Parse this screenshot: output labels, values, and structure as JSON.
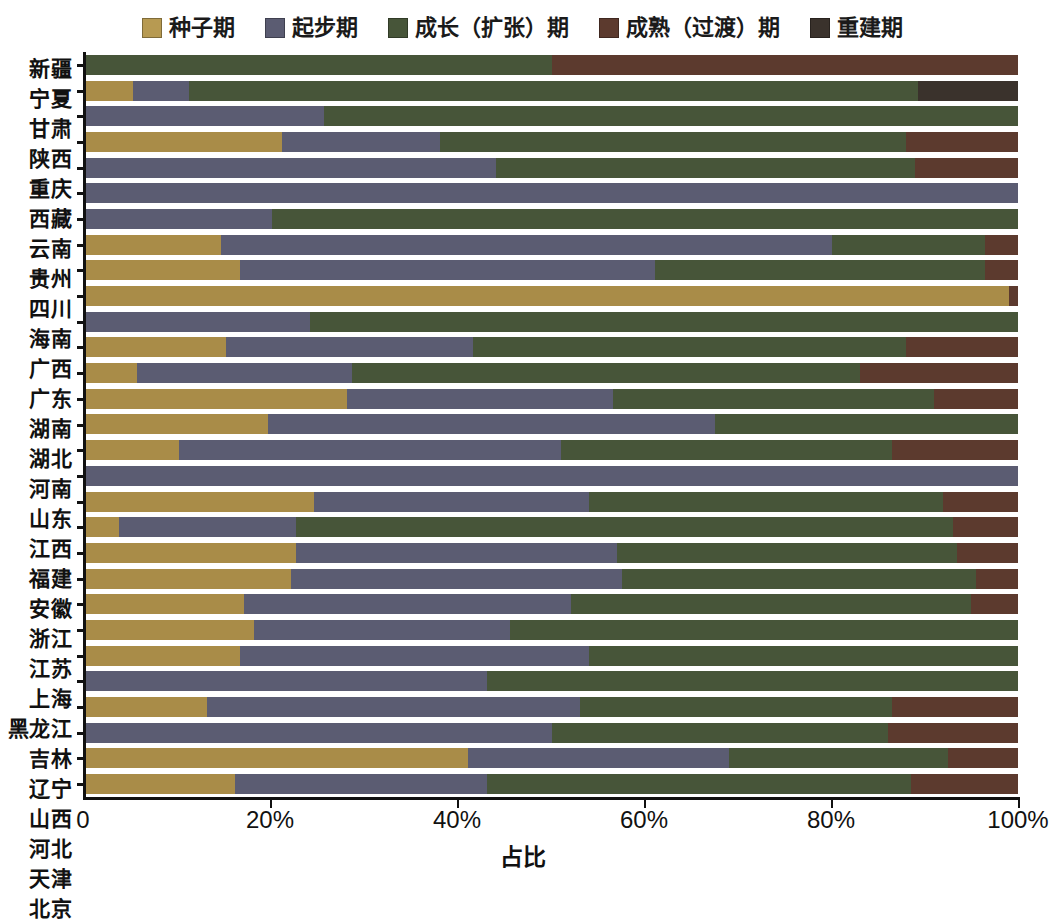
{
  "legend": {
    "items": [
      {
        "label": "种子期",
        "color": "#b79a52",
        "key": "seed"
      },
      {
        "label": "起步期",
        "color": "#5b5c72",
        "key": "startup"
      },
      {
        "label": "成长（扩张）期",
        "color": "#475539",
        "key": "growth"
      },
      {
        "label": "成熟（过渡）期",
        "color": "#5c3a2e",
        "key": "mature"
      },
      {
        "label": "重建期",
        "color": "#3a322c",
        "key": "rebuild"
      }
    ]
  },
  "axis": {
    "x_title": "占比",
    "x_ticks": [
      "0",
      "20%",
      "40%",
      "60%",
      "80%",
      "100%"
    ],
    "x_tick_values": [
      0,
      20,
      40,
      60,
      80,
      100
    ],
    "x_min": 0,
    "x_max": 100
  },
  "colors": {
    "seed": "#a98c48",
    "startup": "#5b5c72",
    "growth": "#475539",
    "mature": "#5c3a2e",
    "rebuild": "#3a322c",
    "axis": "#111111",
    "background": "#ffffff"
  },
  "chart_data": {
    "type": "bar",
    "orientation": "horizontal",
    "stacked": true,
    "normalized": true,
    "title": "",
    "xlabel": "占比",
    "ylabel": "",
    "xlim": [
      0,
      100
    ],
    "grid": false,
    "legend_position": "top-center",
    "series_names": [
      "种子期",
      "起步期",
      "成长（扩张）期",
      "成熟（过渡）期",
      "重建期"
    ],
    "categories": [
      "新疆",
      "宁夏",
      "甘肃",
      "陕西",
      "重庆",
      "西藏",
      "云南",
      "贵州",
      "四川",
      "海南",
      "广西",
      "广东",
      "湖南",
      "湖北",
      "河南",
      "山东",
      "江西",
      "福建",
      "安徽",
      "浙江",
      "江苏",
      "上海",
      "黑龙江",
      "吉林",
      "辽宁",
      "山西",
      "河北",
      "天津",
      "北京"
    ],
    "rows": [
      {
        "category": "新疆",
        "seed": 0.0,
        "startup": 0.0,
        "growth": 50.0,
        "mature": 50.0,
        "rebuild": 0.0
      },
      {
        "category": "宁夏",
        "seed": 5.0,
        "startup": 6.0,
        "growth": 78.3,
        "mature": 0.0,
        "rebuild": 10.7
      },
      {
        "category": "甘肃",
        "seed": 0.0,
        "startup": 25.5,
        "growth": 74.5,
        "mature": 0.0,
        "rebuild": 0.0
      },
      {
        "category": "陕西",
        "seed": 21.0,
        "startup": 17.0,
        "growth": 50.0,
        "mature": 12.0,
        "rebuild": 0.0
      },
      {
        "category": "重庆",
        "seed": 0.0,
        "startup": 44.0,
        "growth": 45.0,
        "mature": 11.0,
        "rebuild": 0.0
      },
      {
        "category": "西藏",
        "seed": 0.0,
        "startup": 100.0,
        "growth": 0.0,
        "mature": 0.0,
        "rebuild": 0.0
      },
      {
        "category": "云南",
        "seed": 0.0,
        "startup": 20.0,
        "growth": 80.0,
        "mature": 0.0,
        "rebuild": 0.0
      },
      {
        "category": "贵州",
        "seed": 14.5,
        "startup": 65.5,
        "growth": 16.5,
        "mature": 3.5,
        "rebuild": 0.0
      },
      {
        "category": "四川",
        "seed": 16.5,
        "startup": 44.5,
        "growth": 35.5,
        "mature": 3.5,
        "rebuild": 0.0
      },
      {
        "category": "海南",
        "seed": 99.0,
        "startup": 0.0,
        "growth": 0.0,
        "mature": 1.0,
        "rebuild": 0.0
      },
      {
        "category": "广西",
        "seed": 0.0,
        "startup": 24.0,
        "growth": 76.0,
        "mature": 0.0,
        "rebuild": 0.0
      },
      {
        "category": "广东",
        "seed": 15.0,
        "startup": 26.5,
        "growth": 46.5,
        "mature": 12.0,
        "rebuild": 0.0
      },
      {
        "category": "湖南",
        "seed": 5.5,
        "startup": 23.0,
        "growth": 54.5,
        "mature": 17.0,
        "rebuild": 0.0
      },
      {
        "category": "湖北",
        "seed": 28.0,
        "startup": 28.5,
        "growth": 34.5,
        "mature": 9.0,
        "rebuild": 0.0
      },
      {
        "category": "河南",
        "seed": 19.5,
        "startup": 48.0,
        "growth": 32.5,
        "mature": 0.0,
        "rebuild": 0.0
      },
      {
        "category": "山东",
        "seed": 10.0,
        "startup": 41.0,
        "growth": 35.5,
        "mature": 13.5,
        "rebuild": 0.0
      },
      {
        "category": "江西",
        "seed": 0.0,
        "startup": 100.0,
        "growth": 0.0,
        "mature": 0.0,
        "rebuild": 0.0
      },
      {
        "category": "福建",
        "seed": 24.5,
        "startup": 29.5,
        "growth": 38.0,
        "mature": 8.0,
        "rebuild": 0.0
      },
      {
        "category": "安徽",
        "seed": 3.5,
        "startup": 19.0,
        "growth": 70.5,
        "mature": 7.0,
        "rebuild": 0.0
      },
      {
        "category": "浙江",
        "seed": 22.5,
        "startup": 34.5,
        "growth": 36.5,
        "mature": 6.5,
        "rebuild": 0.0
      },
      {
        "category": "江苏",
        "seed": 22.0,
        "startup": 35.5,
        "growth": 38.0,
        "mature": 4.5,
        "rebuild": 0.0
      },
      {
        "category": "上海",
        "seed": 17.0,
        "startup": 35.0,
        "growth": 43.0,
        "mature": 5.0,
        "rebuild": 0.0
      },
      {
        "category": "黑龙江",
        "seed": 18.0,
        "startup": 27.5,
        "growth": 54.5,
        "mature": 0.0,
        "rebuild": 0.0
      },
      {
        "category": "吉林",
        "seed": 16.5,
        "startup": 37.5,
        "growth": 46.0,
        "mature": 0.0,
        "rebuild": 0.0
      },
      {
        "category": "辽宁",
        "seed": 0.0,
        "startup": 43.0,
        "growth": 57.0,
        "mature": 0.0,
        "rebuild": 0.0
      },
      {
        "category": "山西",
        "seed": 13.0,
        "startup": 40.0,
        "growth": 33.5,
        "mature": 13.5,
        "rebuild": 0.0
      },
      {
        "category": "河北",
        "seed": 0.0,
        "startup": 50.0,
        "growth": 36.0,
        "mature": 14.0,
        "rebuild": 0.0
      },
      {
        "category": "天津",
        "seed": 41.0,
        "startup": 28.0,
        "growth": 23.5,
        "mature": 7.5,
        "rebuild": 0.0
      },
      {
        "category": "北京",
        "seed": 16.0,
        "startup": 27.0,
        "growth": 45.5,
        "mature": 11.5,
        "rebuild": 0.0
      }
    ]
  }
}
